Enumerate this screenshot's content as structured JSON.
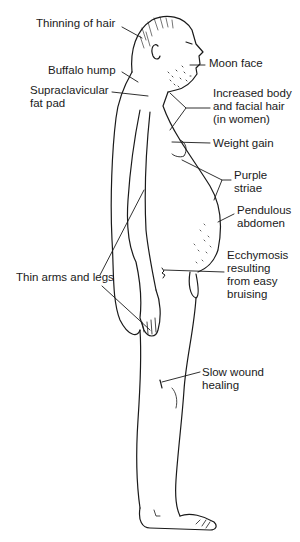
{
  "diagram": {
    "labels": [
      {
        "id": "thinning-of-hair",
        "text": "Thinning of hair",
        "x": 36,
        "y": 17
      },
      {
        "id": "moon-face",
        "text": "Moon face",
        "x": 209,
        "y": 57
      },
      {
        "id": "buffalo-hump",
        "text": "Buffalo hump",
        "x": 48,
        "y": 64
      },
      {
        "id": "supraclavicular-fat-pad",
        "text": "Supraclavicular\nfat pad",
        "x": 30,
        "y": 84
      },
      {
        "id": "increased-body-facial-hair",
        "text": "Increased body\nand facial hair\n(in women)",
        "x": 213,
        "y": 87
      },
      {
        "id": "weight-gain",
        "text": "Weight gain",
        "x": 213,
        "y": 137
      },
      {
        "id": "purple-striae",
        "text": "Purple\nstriae",
        "x": 234,
        "y": 169
      },
      {
        "id": "pendulous-abdomen",
        "text": "Pendulous\nabdomen",
        "x": 237,
        "y": 204
      },
      {
        "id": "ecchymosis",
        "text": "Ecchymosis\nresulting\nfrom easy\nbruising",
        "x": 227,
        "y": 249
      },
      {
        "id": "thin-arms-and-legs",
        "text": "Thin arms and legs",
        "x": 16,
        "y": 271
      },
      {
        "id": "slow-wound-healing",
        "text": "Slow wound\nhealing",
        "x": 202,
        "y": 366
      }
    ],
    "colors": {
      "line": "#1a1a1a",
      "background": "#ffffff"
    }
  }
}
